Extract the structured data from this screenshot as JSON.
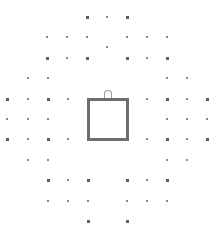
{
  "diagram": {
    "width": 210,
    "height": 237,
    "colors": {
      "background": "#ffffff",
      "box_border": "#6e6e6e",
      "dot": "#6f6f6f"
    },
    "box": {
      "x": 87,
      "y": 98,
      "w": 42,
      "h": 43,
      "border": 3
    },
    "notch": {
      "x": 104,
      "y": 90
    },
    "dots": [
      {
        "x": 87,
        "y": 17,
        "s": "big"
      },
      {
        "x": 107,
        "y": 17,
        "s": "small"
      },
      {
        "x": 127,
        "y": 17,
        "s": "big"
      },
      {
        "x": 47,
        "y": 37,
        "s": "small"
      },
      {
        "x": 67,
        "y": 37,
        "s": "small"
      },
      {
        "x": 87,
        "y": 37,
        "s": "small"
      },
      {
        "x": 127,
        "y": 37,
        "s": "small"
      },
      {
        "x": 147,
        "y": 37,
        "s": "small"
      },
      {
        "x": 167,
        "y": 37,
        "s": "small"
      },
      {
        "x": 107,
        "y": 47,
        "s": "small"
      },
      {
        "x": 47,
        "y": 58,
        "s": "big"
      },
      {
        "x": 67,
        "y": 58,
        "s": "small"
      },
      {
        "x": 87,
        "y": 58,
        "s": "big"
      },
      {
        "x": 127,
        "y": 58,
        "s": "big"
      },
      {
        "x": 147,
        "y": 58,
        "s": "small"
      },
      {
        "x": 167,
        "y": 58,
        "s": "big"
      },
      {
        "x": 28,
        "y": 78,
        "s": "small"
      },
      {
        "x": 48,
        "y": 78,
        "s": "small"
      },
      {
        "x": 167,
        "y": 78,
        "s": "small"
      },
      {
        "x": 187,
        "y": 78,
        "s": "small"
      },
      {
        "x": 7,
        "y": 99,
        "s": "big"
      },
      {
        "x": 28,
        "y": 99,
        "s": "small"
      },
      {
        "x": 48,
        "y": 99,
        "s": "big"
      },
      {
        "x": 68,
        "y": 99,
        "s": "small"
      },
      {
        "x": 147,
        "y": 99,
        "s": "small"
      },
      {
        "x": 167,
        "y": 99,
        "s": "big"
      },
      {
        "x": 187,
        "y": 99,
        "s": "small"
      },
      {
        "x": 207,
        "y": 99,
        "s": "big"
      },
      {
        "x": 7,
        "y": 119,
        "s": "small"
      },
      {
        "x": 28,
        "y": 119,
        "s": "small"
      },
      {
        "x": 48,
        "y": 119,
        "s": "small"
      },
      {
        "x": 167,
        "y": 119,
        "s": "small"
      },
      {
        "x": 187,
        "y": 119,
        "s": "small"
      },
      {
        "x": 207,
        "y": 119,
        "s": "small"
      },
      {
        "x": 7,
        "y": 139,
        "s": "big"
      },
      {
        "x": 28,
        "y": 139,
        "s": "small"
      },
      {
        "x": 48,
        "y": 139,
        "s": "big"
      },
      {
        "x": 68,
        "y": 139,
        "s": "small"
      },
      {
        "x": 147,
        "y": 139,
        "s": "small"
      },
      {
        "x": 167,
        "y": 139,
        "s": "big"
      },
      {
        "x": 187,
        "y": 139,
        "s": "small"
      },
      {
        "x": 207,
        "y": 139,
        "s": "big"
      },
      {
        "x": 28,
        "y": 160,
        "s": "small"
      },
      {
        "x": 48,
        "y": 160,
        "s": "small"
      },
      {
        "x": 167,
        "y": 160,
        "s": "small"
      },
      {
        "x": 187,
        "y": 160,
        "s": "small"
      },
      {
        "x": 48,
        "y": 180,
        "s": "big"
      },
      {
        "x": 68,
        "y": 180,
        "s": "small"
      },
      {
        "x": 88,
        "y": 180,
        "s": "big"
      },
      {
        "x": 127,
        "y": 180,
        "s": "big"
      },
      {
        "x": 147,
        "y": 180,
        "s": "small"
      },
      {
        "x": 167,
        "y": 180,
        "s": "big"
      },
      {
        "x": 48,
        "y": 201,
        "s": "small"
      },
      {
        "x": 68,
        "y": 201,
        "s": "small"
      },
      {
        "x": 88,
        "y": 201,
        "s": "small"
      },
      {
        "x": 127,
        "y": 201,
        "s": "small"
      },
      {
        "x": 147,
        "y": 201,
        "s": "small"
      },
      {
        "x": 167,
        "y": 201,
        "s": "small"
      },
      {
        "x": 88,
        "y": 221,
        "s": "big"
      },
      {
        "x": 127,
        "y": 221,
        "s": "big"
      }
    ]
  }
}
